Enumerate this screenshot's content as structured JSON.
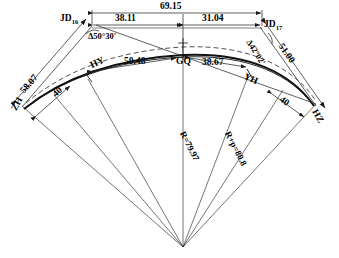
{
  "diagram": {
    "type": "engineering-survey-diagram",
    "colors": {
      "line": "#1a1a1a",
      "background": "#ffffff",
      "text": "#000000"
    },
    "vertices": {
      "jd_left": {
        "label": "JD",
        "subscript": "16"
      },
      "jd_right": {
        "label": "JD",
        "subscript": "17"
      }
    },
    "angles": {
      "left": "Δ50°30'",
      "right": "Δ42°02'"
    },
    "top_dimensions": {
      "total": "69.15",
      "left_segment": "38.11",
      "right_segment": "31.04"
    },
    "tangent_lengths": {
      "left": "58.07",
      "right": "51.00"
    },
    "spiral_lengths": {
      "left": "40",
      "right": "40"
    },
    "arc_dimensions": {
      "left": "50.48",
      "right": "38.67"
    },
    "radii": {
      "curve": "R=79.97",
      "offset": "R+p=80.8"
    },
    "points": {
      "zh": "ZH",
      "hy": "HY",
      "gq": "GQ",
      "yh": "YH",
      "hz": "HZ"
    }
  }
}
